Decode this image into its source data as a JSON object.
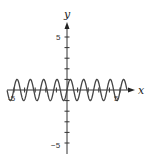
{
  "chart_data": {
    "type": "line",
    "title": "",
    "function": "y = sin(5x)",
    "xlabel": "x",
    "ylabel": "y",
    "xlim": [
      -6,
      6
    ],
    "ylim": [
      -6,
      6
    ],
    "x_tick_labels": [
      "-5",
      "5"
    ],
    "y_tick_labels": [
      "5",
      "-5"
    ],
    "grid": false,
    "legend": null,
    "amplitude": 1,
    "period": 1.257,
    "series": [
      {
        "name": "sin(5x)",
        "x": [
          -6,
          -5,
          -4,
          -3,
          -2,
          -1,
          0,
          1,
          2,
          3,
          4,
          5,
          6
        ],
        "values": [
          0.99,
          0.13,
          -0.91,
          -0.65,
          0.54,
          0.96,
          0,
          -0.96,
          -0.54,
          0.65,
          0.91,
          -0.13,
          -0.99
        ]
      }
    ]
  },
  "axes": {
    "x_label": "x",
    "y_label": "y",
    "x_neg_label": "-5",
    "x_pos_label": "5",
    "y_pos_label": "5",
    "y_neg_label": "−5"
  },
  "colors": {
    "axis": "#333333",
    "curve": "#444444"
  }
}
